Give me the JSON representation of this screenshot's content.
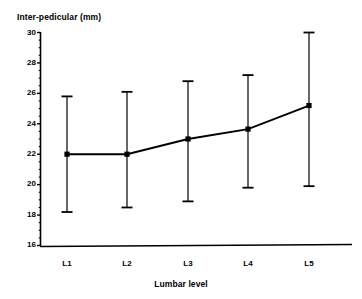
{
  "chart_data": {
    "type": "line",
    "title": "",
    "subtitle": "",
    "xlabel": "Lumbar level",
    "ylabel": "Inter-pedicular (mm)",
    "categories": [
      "L1",
      "L2",
      "L3",
      "L4",
      "L5"
    ],
    "values": [
      22.0,
      22.0,
      23.0,
      23.65,
      25.2
    ],
    "error_upper": [
      25.8,
      26.1,
      26.8,
      27.2,
      30.0
    ],
    "error_lower": [
      18.2,
      18.5,
      18.9,
      19.8,
      19.9
    ],
    "series": [
      {
        "name": "Inter-pedicular distance",
        "values": [
          22.0,
          22.0,
          23.0,
          23.65,
          25.2
        ],
        "error_upper": [
          25.8,
          26.1,
          26.8,
          27.2,
          30.0
        ],
        "error_lower": [
          18.2,
          18.5,
          18.9,
          19.8,
          19.9
        ]
      }
    ],
    "ylim": [
      16,
      30
    ],
    "ytick_labels": [
      "30",
      "28",
      "26",
      "24",
      "22",
      "20",
      "18",
      "16"
    ],
    "ytick_values": [
      30,
      28,
      26,
      24,
      22,
      20,
      18,
      16
    ],
    "yminor_step": 0.5,
    "grid": false,
    "legend": "none",
    "marker": "square",
    "line_color": "#000000",
    "marker_color": "#000000",
    "errorbar_color": "#000000",
    "axis_color": "#000000",
    "background_color": "#ffffff"
  },
  "axes": {
    "y_title": "Inter-pedicular (mm)",
    "x_title": "Lumbar level"
  }
}
